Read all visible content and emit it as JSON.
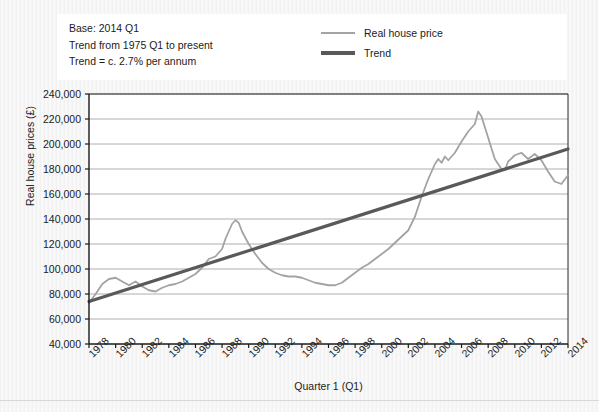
{
  "annotation": {
    "line1": "Base: 2014 Q1",
    "line2": "Trend from 1975 Q1 to present",
    "line3": "Trend = c. 2.7% per annum"
  },
  "legend": {
    "position": "top-right",
    "items": [
      {
        "label": "Real house price",
        "color": "#a3a3a3"
      },
      {
        "label": "Trend",
        "color": "#595959"
      }
    ]
  },
  "chart_data": {
    "type": "line",
    "title": "",
    "subtitle": "",
    "xlabel": "Quarter 1 (Q1)",
    "ylabel": "Real house prices (£)",
    "xlim": [
      1978,
      2014
    ],
    "ylim": [
      40000,
      240000
    ],
    "grid": true,
    "ytick_labels": [
      "40,000",
      "60,000",
      "80,000",
      "100,000",
      "120,000",
      "140,000",
      "160,000",
      "180,000",
      "200,000",
      "220,000",
      "240,000"
    ],
    "yticks": [
      40000,
      60000,
      80000,
      100000,
      120000,
      140000,
      160000,
      180000,
      200000,
      220000,
      240000
    ],
    "xtick_labels": [
      "1978",
      "1980",
      "1982",
      "1984",
      "1986",
      "1988",
      "1990",
      "1992",
      "1994",
      "1996",
      "1998",
      "2000",
      "2002",
      "2004",
      "2006",
      "2008",
      "2010",
      "2012",
      "2014"
    ],
    "xticks": [
      1978,
      1980,
      1982,
      1984,
      1986,
      1988,
      1990,
      1992,
      1994,
      1996,
      1998,
      2000,
      2002,
      2004,
      2006,
      2008,
      2010,
      2012,
      2014
    ],
    "series": [
      {
        "name": "Real house price",
        "color": "#a3a3a3",
        "width": 1.8,
        "x": [
          1978,
          1978.5,
          1979,
          1979.5,
          1980,
          1980.5,
          1981,
          1981.5,
          1982,
          1982.5,
          1983,
          1983.5,
          1984,
          1984.5,
          1985,
          1985.5,
          1986,
          1986.5,
          1987,
          1987.5,
          1988,
          1988.25,
          1988.5,
          1988.75,
          1989,
          1989.25,
          1989.5,
          1990,
          1990.5,
          1991,
          1991.5,
          1992,
          1992.5,
          1993,
          1993.5,
          1994,
          1994.5,
          1995,
          1995.5,
          1996,
          1996.5,
          1997,
          1997.5,
          1998,
          1998.5,
          1999,
          1999.5,
          2000,
          2000.5,
          2001,
          2001.5,
          2002,
          2002.5,
          2003,
          2003.5,
          2004,
          2004.25,
          2004.5,
          2004.75,
          2005,
          2005.5,
          2006,
          2006.5,
          2007,
          2007.25,
          2007.5,
          2008,
          2008.5,
          2009,
          2009.25,
          2009.5,
          2010,
          2010.5,
          2011,
          2011.5,
          2012,
          2012.5,
          2013,
          2013.5,
          2014
        ],
        "y": [
          73000,
          80000,
          88000,
          92000,
          93000,
          90000,
          87000,
          90000,
          86000,
          83000,
          82000,
          85000,
          87000,
          88000,
          90000,
          93000,
          96000,
          101000,
          108000,
          110000,
          116000,
          124000,
          130000,
          136000,
          139000,
          137000,
          130000,
          120000,
          112000,
          105000,
          100000,
          97000,
          95000,
          94000,
          94000,
          93000,
          91000,
          89000,
          88000,
          87000,
          87000,
          89000,
          93000,
          97000,
          101000,
          104000,
          108000,
          112000,
          116000,
          121000,
          126000,
          131000,
          142000,
          158000,
          172000,
          184000,
          188000,
          185000,
          190000,
          187000,
          193000,
          202000,
          210000,
          216000,
          226000,
          222000,
          205000,
          188000,
          180000,
          179000,
          186000,
          191000,
          193000,
          188000,
          192000,
          187000,
          178000,
          170000,
          168000,
          175000
        ]
      },
      {
        "name": "Trend",
        "color": "#595959",
        "width": 3.2,
        "x": [
          1978,
          2014
        ],
        "y": [
          74000,
          196000
        ]
      }
    ],
    "annotations": [
      "Base: 2014 Q1",
      "Trend from 1975 Q1 to present",
      "Trend = c. 2.7% per annum"
    ]
  },
  "plot_geometry": {
    "left": 89,
    "right": 568,
    "top": 94,
    "bottom": 344
  }
}
